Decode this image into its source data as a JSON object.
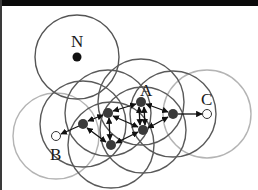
{
  "diagram": {
    "type": "wireless network coverage graph",
    "colors": {
      "background": "#ffffff",
      "frame": "#0a0a0a",
      "circle_dark": "#5a5a5a",
      "circle_light": "#b4b4b4",
      "node_fill": "#3a3a3a",
      "source_fill": "#111111",
      "open_fill": "#ffffff",
      "edge": "#111111"
    },
    "labels": {
      "N": "N",
      "A": "A",
      "B": "B",
      "C": "C"
    },
    "nodes": [
      {
        "id": "N",
        "x": 77,
        "y": 57,
        "kind": "isolated"
      },
      {
        "id": "n1",
        "x": 83,
        "y": 124,
        "kind": "relay"
      },
      {
        "id": "n2",
        "x": 108,
        "y": 113,
        "kind": "relay"
      },
      {
        "id": "A",
        "x": 141,
        "y": 102,
        "kind": "relay"
      },
      {
        "id": "n4",
        "x": 143,
        "y": 130,
        "kind": "relay"
      },
      {
        "id": "n5",
        "x": 111,
        "y": 145,
        "kind": "relay"
      },
      {
        "id": "n6",
        "x": 173,
        "y": 114,
        "kind": "relay"
      },
      {
        "id": "B",
        "x": 56,
        "y": 136,
        "kind": "endpoint"
      },
      {
        "id": "C",
        "x": 207,
        "y": 114,
        "kind": "endpoint"
      }
    ],
    "edges": [
      {
        "from": "n1",
        "to": "B",
        "dir": "one-way"
      },
      {
        "from": "n1",
        "to": "n2",
        "dir": "two-way"
      },
      {
        "from": "n1",
        "to": "n5",
        "dir": "two-way"
      },
      {
        "from": "n2",
        "to": "A",
        "dir": "two-way"
      },
      {
        "from": "n2",
        "to": "n5",
        "dir": "two-way"
      },
      {
        "from": "n2",
        "to": "n4",
        "dir": "two-way"
      },
      {
        "from": "A",
        "to": "n4",
        "dir": "two-way"
      },
      {
        "from": "n5",
        "to": "n4",
        "dir": "two-way"
      },
      {
        "from": "A",
        "to": "n6",
        "dir": "two-way"
      },
      {
        "from": "n4",
        "to": "n6",
        "dir": "two-way"
      },
      {
        "from": "n6",
        "to": "C",
        "dir": "one-way"
      }
    ],
    "coverage_radius": 43
  }
}
